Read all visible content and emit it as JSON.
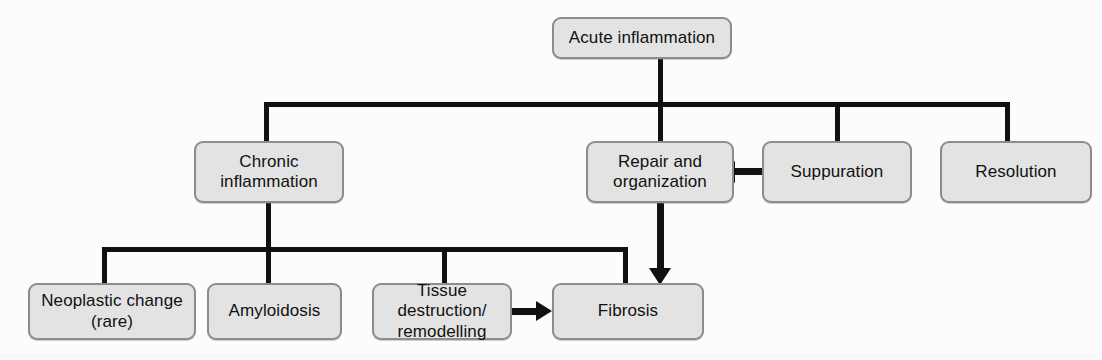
{
  "diagram": {
    "type": "flowchart",
    "colors": {
      "node_fill": "#e3e3e3",
      "node_border": "#8c8c8c",
      "connector": "#111111",
      "text": "#111111",
      "background": "#fcfcfc"
    },
    "nodes": [
      {
        "id": "acute",
        "label": "Acute inflammation"
      },
      {
        "id": "chronic",
        "label": "Chronic inflammation"
      },
      {
        "id": "repair",
        "label": "Repair and organization"
      },
      {
        "id": "suppuration",
        "label": "Suppuration"
      },
      {
        "id": "resolution",
        "label": "Resolution"
      },
      {
        "id": "neoplastic",
        "label": "Neoplastic change (rare)"
      },
      {
        "id": "amyloidosis",
        "label": "Amyloidosis"
      },
      {
        "id": "tissue",
        "label": "Tissue destruction/ remodelling"
      },
      {
        "id": "fibrosis",
        "label": "Fibrosis"
      }
    ],
    "node_lines": {
      "acute": [
        "Acute inflammation"
      ],
      "chronic": [
        "Chronic",
        "inflammation"
      ],
      "repair": [
        "Repair and",
        "organization"
      ],
      "suppuration": [
        "Suppuration"
      ],
      "resolution": [
        "Resolution"
      ],
      "neoplastic": [
        "Neoplastic change",
        "(rare)"
      ],
      "amyloidosis": [
        "Amyloidosis"
      ],
      "tissue": [
        "Tissue destruction/",
        "remodelling"
      ],
      "fibrosis": [
        "Fibrosis"
      ]
    },
    "edges": [
      {
        "from": "acute",
        "to": "chronic",
        "style": "elbow",
        "arrow": false
      },
      {
        "from": "acute",
        "to": "repair",
        "style": "elbow",
        "arrow": false
      },
      {
        "from": "acute",
        "to": "suppuration",
        "style": "elbow",
        "arrow": false
      },
      {
        "from": "acute",
        "to": "resolution",
        "style": "elbow",
        "arrow": false
      },
      {
        "from": "chronic",
        "to": "neoplastic",
        "style": "elbow",
        "arrow": false
      },
      {
        "from": "chronic",
        "to": "amyloidosis",
        "style": "elbow",
        "arrow": false
      },
      {
        "from": "chronic",
        "to": "tissue",
        "style": "elbow",
        "arrow": false
      },
      {
        "from": "chronic",
        "to": "fibrosis",
        "style": "elbow",
        "arrow": false
      },
      {
        "from": "suppuration",
        "to": "repair",
        "style": "straight",
        "arrow": true,
        "direction": "left"
      },
      {
        "from": "repair",
        "to": "fibrosis",
        "style": "straight",
        "arrow": true,
        "direction": "down"
      },
      {
        "from": "tissue",
        "to": "fibrosis",
        "style": "straight",
        "arrow": true,
        "direction": "right"
      }
    ]
  }
}
